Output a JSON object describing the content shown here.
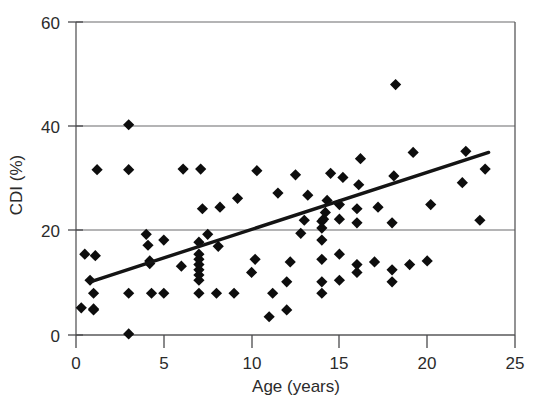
{
  "chart_data": {
    "type": "scatter",
    "title": "",
    "xlabel": "Age (years)",
    "ylabel": "CDI (%)",
    "xlim": [
      0,
      25
    ],
    "ylim": [
      0,
      60
    ],
    "xticks": [
      0,
      5,
      10,
      15,
      20,
      25
    ],
    "yticks": [
      0,
      20,
      40,
      60
    ],
    "xtick_labels": [
      "0",
      "5",
      "10",
      "15",
      "20",
      "25"
    ],
    "ytick_labels": [
      "0",
      "20",
      "40",
      "60"
    ],
    "grid": "horizontal gridlines at y = 20, 40, 60 only",
    "legend": "none",
    "marker_style": "filled black diamond",
    "annotations": [],
    "series": [
      {
        "name": "Patients",
        "type": "scatter",
        "n_points": 86,
        "x": [
          0.3,
          0.5,
          0.8,
          1.0,
          1.0,
          1.0,
          1.1,
          1.2,
          3.0,
          3.0,
          3.0,
          3.0,
          4.0,
          4.1,
          4.2,
          4.2,
          4.3,
          5.0,
          5.0,
          6.0,
          6.1,
          7.0,
          7.0,
          7.0,
          7.0,
          7.0,
          7.0,
          7.0,
          7.0,
          7.1,
          7.2,
          7.5,
          8.0,
          8.1,
          8.2,
          9.0,
          9.2,
          10.0,
          10.2,
          10.3,
          11.0,
          11.2,
          11.5,
          12.0,
          12.0,
          12.2,
          12.5,
          13.0,
          13.2,
          14.0,
          14.0,
          14.0,
          14.0,
          14.0,
          14.0,
          14.1,
          14.2,
          14.3,
          14.5,
          15.0,
          15.0,
          15.0,
          15.0,
          15.2,
          16.0,
          16.0,
          16.0,
          16.0,
          16.1,
          16.2,
          17.0,
          17.2,
          18.0,
          18.0,
          18.0,
          18.1,
          18.2,
          19.0,
          19.2,
          20.0,
          20.2,
          22.0,
          22.2,
          23.0,
          23.3,
          12.8
        ],
        "y": [
          5.2,
          15.5,
          10.5,
          4.8,
          5.0,
          8.0,
          15.2,
          31.7,
          0.2,
          8.0,
          31.7,
          40.3,
          19.3,
          17.2,
          14.2,
          13.7,
          8.0,
          8.0,
          18.2,
          13.2,
          31.8,
          8.0,
          10.5,
          11.5,
          12.5,
          13.5,
          14.5,
          15.5,
          17.8,
          31.8,
          24.2,
          19.3,
          8.0,
          17.0,
          24.5,
          8.0,
          26.2,
          12.0,
          14.5,
          31.5,
          3.5,
          8.0,
          27.2,
          4.8,
          10.2,
          14.0,
          30.7,
          22.0,
          26.8,
          8.0,
          10.2,
          14.5,
          18.2,
          20.5,
          21.8,
          22.2,
          23.5,
          25.8,
          31.0,
          10.5,
          15.5,
          22.2,
          25.0,
          30.2,
          12.0,
          13.5,
          21.5,
          24.2,
          28.8,
          33.8,
          14.0,
          24.5,
          10.2,
          12.5,
          21.5,
          30.5,
          48.0,
          13.5,
          35.0,
          14.2,
          25.0,
          29.2,
          35.2,
          22.0,
          31.8,
          19.5
        ],
        "color": "#0d0d0d"
      },
      {
        "name": "Linear regression trend",
        "type": "line",
        "x": [
          0.9,
          23.5
        ],
        "y": [
          10.3,
          35.0
        ],
        "color": "#141414"
      }
    ]
  },
  "axes": {
    "x_axis_title": "Age (years)",
    "y_axis_title": "CDI (%)"
  }
}
